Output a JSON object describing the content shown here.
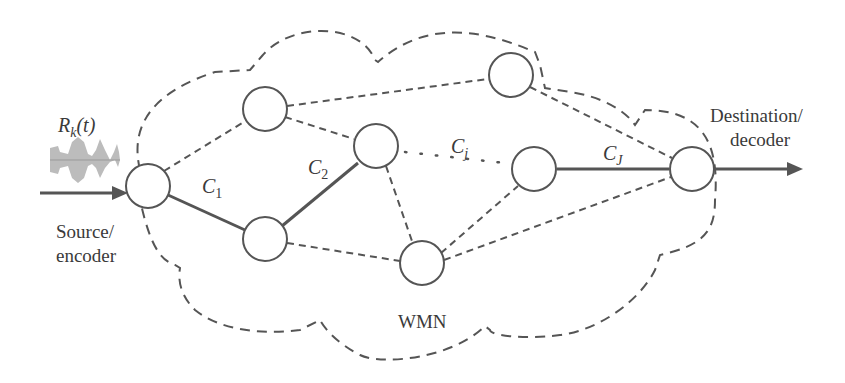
{
  "diagram": {
    "network_label": "WMN",
    "signal_label": "R_k(t)",
    "signal_label_main": "R",
    "signal_label_sub": "k",
    "signal_label_arg": "(t)",
    "source_label_line1": "Source/",
    "source_label_line2": "encoder",
    "destination_label_line1": "Destination/",
    "destination_label_line2": "decoder",
    "links": {
      "c1": {
        "main": "C",
        "sub": "1"
      },
      "c2": {
        "main": "C",
        "sub": "2"
      },
      "cj": {
        "main": "C",
        "sub": "j"
      },
      "cJ": {
        "main": "C",
        "sub": "J"
      }
    },
    "colors": {
      "stroke": "#555555",
      "text": "#3a3a3a",
      "signal": "#b8b8b8"
    }
  }
}
